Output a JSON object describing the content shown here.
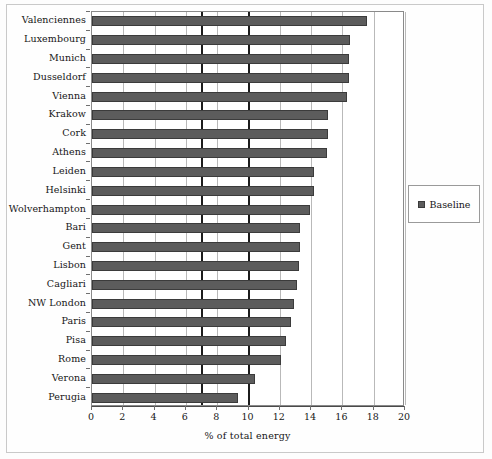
{
  "chart_data": {
    "type": "bar",
    "orientation": "horizontal",
    "title": "",
    "xlabel": "% of total energy",
    "ylabel": "",
    "xlim": [
      0,
      20
    ],
    "xticks": [
      0,
      2,
      4,
      6,
      8,
      10,
      12,
      14,
      16,
      18,
      20
    ],
    "grid": true,
    "reference_lines": [
      7,
      10
    ],
    "legend": {
      "position": "right",
      "entries": [
        "Baseline"
      ]
    },
    "series": [
      {
        "name": "Baseline",
        "color": "#5c5c5c",
        "categories": [
          "Valenciennes",
          "Luxembourg",
          "Munich",
          "Dusseldorf",
          "Vienna",
          "Krakow",
          "Cork",
          "Athens",
          "Leiden",
          "Helsinki",
          "Wolverhampton",
          "Bari",
          "Gent",
          "Lisbon",
          "Cagliari",
          "NW London",
          "Paris",
          "Pisa",
          "Rome",
          "Verona",
          "Perugia"
        ],
        "values": [
          17.6,
          16.5,
          16.4,
          16.4,
          16.3,
          15.1,
          15.1,
          15.0,
          14.2,
          14.2,
          13.9,
          13.3,
          13.3,
          13.2,
          13.1,
          12.9,
          12.7,
          12.4,
          12.1,
          10.4,
          9.3
        ]
      }
    ]
  },
  "legend": {
    "label": "Baseline",
    "swatch_color": "#5c5c5c"
  },
  "axis": {
    "x_title": "% of total energy"
  }
}
